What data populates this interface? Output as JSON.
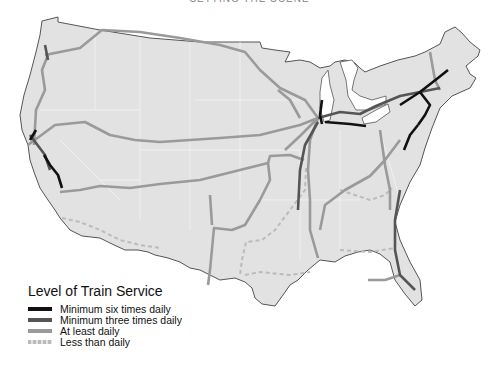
{
  "header": {
    "text": "SETTING THE SCENE"
  },
  "map": {
    "title": "Passenger rail routes of the contiguous United States",
    "colors": {
      "land": "#e2e2e2",
      "border": "#555555",
      "state_lines": "#f2f2f2"
    }
  },
  "legend": {
    "title": "Level of Train Service",
    "items": [
      {
        "label": "Minimum six times daily",
        "color": "#111111"
      },
      {
        "label": "Minimum three times daily",
        "color": "#555555"
      },
      {
        "label": "At least daily",
        "color": "#9a9a9a"
      },
      {
        "label": "Less than daily",
        "color": "#bbbbbb",
        "style": "dashed"
      }
    ]
  }
}
